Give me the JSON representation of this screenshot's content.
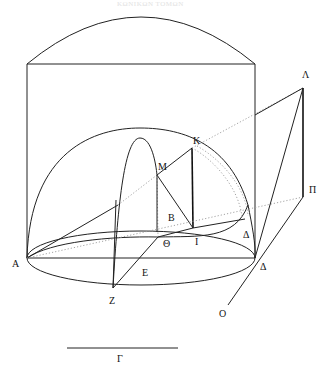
{
  "header": {
    "text": "ΚΩΝΙΚΩΝ ΤΟΜΩΝ"
  },
  "diagram": {
    "stroke_color": "#222222",
    "dotted_color": "#9a9a9a",
    "points": {
      "A": {
        "label": "Α",
        "x": 27,
        "y": 258
      },
      "B": {
        "label": "Β",
        "x": 173,
        "y": 223
      },
      "Gamma": {
        "label": "Γ",
        "x": 122,
        "y": 357
      },
      "Delta_upper": {
        "label": "Δ",
        "x": 248,
        "y": 238
      },
      "Delta_lower": {
        "label": "Δ",
        "x": 262,
        "y": 264
      },
      "E": {
        "label": "Ε",
        "x": 148,
        "y": 273
      },
      "Z": {
        "label": "Ζ",
        "x": 114,
        "y": 302
      },
      "Theta": {
        "label": "Θ",
        "x": 168,
        "y": 242
      },
      "I": {
        "label": "Ι",
        "x": 198,
        "y": 241
      },
      "K": {
        "label": "Κ",
        "x": 196,
        "y": 145
      },
      "Lambda": {
        "label": "Λ",
        "x": 305,
        "y": 78
      },
      "M": {
        "label": "Μ",
        "x": 162,
        "y": 170
      },
      "Pi": {
        "label": "Π",
        "x": 308,
        "y": 192
      },
      "O": {
        "label": "Ο",
        "x": 220,
        "y": 314
      }
    },
    "scale_bar": {
      "label": "Γ",
      "x1": 67,
      "x2": 178,
      "y": 348
    }
  }
}
